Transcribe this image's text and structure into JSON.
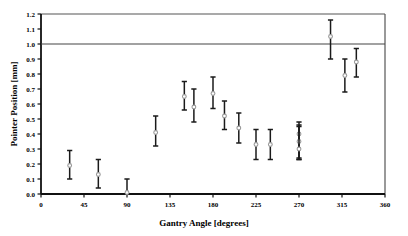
{
  "chart_data": {
    "type": "scatter",
    "title": "",
    "xlabel": "Gantry Angle [degrees]",
    "ylabel": "Pointer Position [mm]",
    "xlim": [
      0,
      360
    ],
    "ylim": [
      0.0,
      1.2
    ],
    "xticks": [
      0,
      45,
      90,
      135,
      180,
      225,
      270,
      315,
      360
    ],
    "xtick_labels": [
      "0",
      "45",
      "90",
      "135",
      "180",
      "225",
      "270",
      "315",
      "360"
    ],
    "yticks": [
      0.0,
      0.1,
      0.2,
      0.3,
      0.4,
      0.5,
      0.6,
      0.7,
      0.8,
      0.9,
      1.0,
      1.1,
      1.2
    ],
    "ytick_labels": [
      "0.0",
      "0.1",
      "0.2",
      "0.3",
      "0.4",
      "0.5",
      "0.6",
      "0.7",
      "0.8",
      "0.9",
      "1.0",
      "1.1",
      "1.2"
    ],
    "grid": false,
    "legend": null,
    "error_bars": true,
    "marker": "open-circle",
    "marker_color": "#999999",
    "errorbar_color": "#1a1a1a",
    "reference_lines": [
      {
        "name": "tolerance-line",
        "y": 1.0,
        "color": "#444444"
      }
    ],
    "frame_top_y": 1.2,
    "series": [
      {
        "name": "Pointer Position",
        "points": [
          {
            "x": 30,
            "y": 0.19,
            "low": 0.1,
            "high": 0.29
          },
          {
            "x": 60,
            "y": 0.13,
            "low": 0.04,
            "high": 0.23
          },
          {
            "x": 90,
            "y": 0.01,
            "low": 0.0,
            "high": 0.1
          },
          {
            "x": 120,
            "y": 0.41,
            "low": 0.32,
            "high": 0.52
          },
          {
            "x": 150,
            "y": 0.65,
            "low": 0.56,
            "high": 0.75
          },
          {
            "x": 160,
            "y": 0.58,
            "low": 0.48,
            "high": 0.7
          },
          {
            "x": 180,
            "y": 0.67,
            "low": 0.57,
            "high": 0.78
          },
          {
            "x": 192,
            "y": 0.52,
            "low": 0.43,
            "high": 0.62
          },
          {
            "x": 207,
            "y": 0.44,
            "low": 0.34,
            "high": 0.54
          },
          {
            "x": 225,
            "y": 0.33,
            "low": 0.23,
            "high": 0.43
          },
          {
            "x": 240,
            "y": 0.33,
            "low": 0.23,
            "high": 0.43
          },
          {
            "x": 270,
            "y": 0.4,
            "low": 0.23,
            "high": 0.48
          },
          {
            "x": 270,
            "y": 0.35,
            "low": 0.24,
            "high": 0.46
          },
          {
            "x": 270,
            "y": 0.3,
            "low": 0.23,
            "high": 0.45
          },
          {
            "x": 303,
            "y": 1.05,
            "low": 0.9,
            "high": 1.16
          },
          {
            "x": 318,
            "y": 0.79,
            "low": 0.68,
            "high": 0.9
          },
          {
            "x": 330,
            "y": 0.88,
            "low": 0.78,
            "high": 0.97
          }
        ]
      }
    ]
  },
  "axes": {
    "x_title": "Gantry Angle [degrees]",
    "y_title": "Pointer Position [mm]"
  }
}
